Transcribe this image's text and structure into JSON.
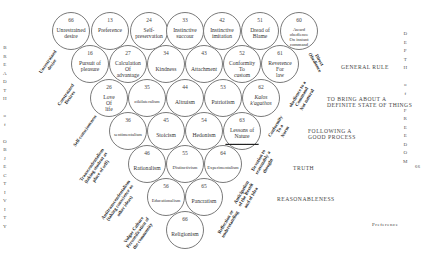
{
  "left_axis": {
    "letters": [
      "B",
      "R",
      "E",
      "A",
      "D",
      "T",
      "H",
      "",
      "o",
      "f",
      "",
      "O",
      "B",
      "J",
      "E",
      "C",
      "T",
      "I",
      "V",
      "I",
      "T",
      "Y"
    ]
  },
  "right_axis": {
    "letters": [
      "D",
      "E",
      "P",
      "T",
      "H",
      "",
      "o",
      "f",
      "",
      "F",
      "R",
      "E",
      "E",
      "D",
      "O",
      "M"
    ]
  },
  "circles": [
    {
      "id": "c66",
      "num": "66",
      "label": "Unrestrained\ndesire"
    },
    {
      "id": "c13",
      "num": "13",
      "label": "Preference"
    },
    {
      "id": "c24",
      "num": "24",
      "label": "Self-\npreservation"
    },
    {
      "id": "c33",
      "num": "33",
      "label": "Instinctive\nsuccour"
    },
    {
      "id": "c42",
      "num": "42",
      "label": "Instinctive\nimitation"
    },
    {
      "id": "c51",
      "num": "51",
      "label": "Dread of\nBlame"
    },
    {
      "id": "c60",
      "num": "60",
      "label": "Award obedience\nOn instant\ncommand"
    },
    {
      "id": "c16",
      "num": "16",
      "label": "Pursuit of\npleasure"
    },
    {
      "id": "c27",
      "num": "27",
      "label": "Calculation\nOf\nadvantage"
    },
    {
      "id": "c34",
      "num": "34",
      "label": "Kindness"
    },
    {
      "id": "c43",
      "num": "43",
      "label": "Attachment"
    },
    {
      "id": "c52",
      "num": "52",
      "label": "Conformity\nTo\ncustom"
    },
    {
      "id": "c61",
      "num": "61",
      "label": "Reverence\nFor\nlaw"
    },
    {
      "id": "c26",
      "num": "26",
      "label": "Love\nOf\nlife"
    },
    {
      "id": "c35",
      "num": "35",
      "label": "oikilateralism"
    },
    {
      "id": "c44",
      "num": "44",
      "label": "Altruism"
    },
    {
      "id": "c53",
      "num": "53",
      "label": "Patriotism"
    },
    {
      "id": "c62",
      "num": "62",
      "label": "Kalos\nk'agathos"
    },
    {
      "id": "c36",
      "num": "36",
      "label": "sentimentalism"
    },
    {
      "id": "c45",
      "num": "45",
      "label": "Stoicism"
    },
    {
      "id": "c54",
      "num": "54",
      "label": "Hedonism"
    },
    {
      "id": "c63",
      "num": "63",
      "label": "Lessons of\nNature",
      "sub": "___________________"
    },
    {
      "id": "c46",
      "num": "46",
      "label": "Rationalism"
    },
    {
      "id": "c55",
      "num": "55",
      "label": "Distinctivism"
    },
    {
      "id": "c64",
      "num": "64",
      "label": "Experimentalism"
    },
    {
      "id": "c56",
      "num": "56",
      "label": "Educationalism"
    },
    {
      "id": "c65",
      "num": "65",
      "label": "Pancratism"
    },
    {
      "id": "c66b",
      "num": "66",
      "label": "Religionism"
    }
  ],
  "rotated_labels": [
    {
      "id": "unrestrained-desire",
      "text": "Unrestrained\ndesire"
    },
    {
      "id": "constrained-desires",
      "text": "Constrained\nDesires"
    },
    {
      "id": "self-consciousness",
      "text": "Self-consciousness"
    },
    {
      "id": "transcendentalism",
      "text": "Transcendentalism\n(taking student as\nplace of self)"
    },
    {
      "id": "antitranscendentalism",
      "text": "Antitranscendentalism\n(taking conscience as\nother ideas)"
    },
    {
      "id": "vulgar-culture",
      "text": "Vulgar Culture\nPersonification of\nthe community"
    },
    {
      "id": "direct-obedience",
      "text": "Direct\nObedience"
    },
    {
      "id": "obedience-to-command",
      "text": "obedience to a\nCommand\nNot natural"
    },
    {
      "id": "conformity-to-norm",
      "text": "Conformity\nTo a\nNorm"
    },
    {
      "id": "devotion-to-reasonably",
      "text": "Devotion to\nreasonably a\nthought"
    },
    {
      "id": "anticipation",
      "text": "Anticipation\nof the Result\nand of Idea"
    },
    {
      "id": "reflection",
      "text": "Reflection or\nunderstanding"
    }
  ],
  "side_labels": {
    "general_rule": "GENERAL RULE",
    "definite_state": "TO BRING ABOUT A\nDEFINITE STATE OF THINGS",
    "good_process": "FOLLOWING A\nGOOD PROCESS",
    "truth": "TRUTH",
    "reasonableness": "REASONABLENESS",
    "preference": "Preference",
    "page_num": "66"
  }
}
